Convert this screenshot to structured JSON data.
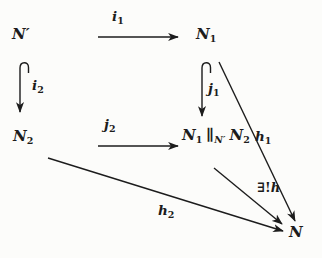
{
  "colors": {
    "ink": "#1c1c1c",
    "background": "#fcfcfa"
  },
  "nodes": {
    "n_prime": "N′",
    "n1": {
      "base": "N",
      "sub": "1"
    },
    "n2": {
      "base": "N",
      "sub": "2"
    },
    "pushout": {
      "p1": "N",
      "p1sub": "1",
      "p2": "∥",
      "p2sub": "N′",
      "p3": "N",
      "p3sub": "2"
    },
    "n": "N"
  },
  "arrow_labels": {
    "i1": {
      "base": "i",
      "sub": "1"
    },
    "i2": {
      "base": "i",
      "sub": "2"
    },
    "j1": {
      "base": "j",
      "sub": "1"
    },
    "j2": {
      "base": "j",
      "sub": "2"
    },
    "h1": {
      "base": "h",
      "sub": "1"
    },
    "h2": {
      "base": "h",
      "sub": "2"
    },
    "exists_unique_h": {
      "prefix": "∃!",
      "base": "h"
    }
  }
}
